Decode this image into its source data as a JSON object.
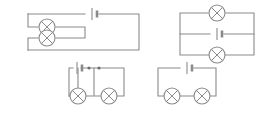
{
  "figure": {
    "background_color": "#ffffff",
    "line_color": "#8a8a8a",
    "label_color": "#5a5a5a",
    "width": 266,
    "height": 115
  },
  "circuits": [
    {
      "id": "A",
      "label": "A",
      "label_x": 12,
      "label_y": 20,
      "description": "Battery in top wire; two lamps connected in parallel with each other on the left, outer loop closing at the right",
      "lamp_count": 2,
      "battery_count": 1,
      "junction_dot_count": 0,
      "topology": "two lamps in parallel",
      "outline": "M 28 14 L 85 14 M 99 14 L 139 14 L 139 50 L 28 50",
      "battery": {
        "x": 92,
        "y": 14,
        "orientation": "horizontal"
      },
      "branch_wires": "M 28 14 L 28 27 L 38 27 M 56 27 L 85 27 L 85 38 L 56 38 M 38 38 L 28 38 L 28 50",
      "lamps": [
        {
          "cx": 47,
          "cy": 27,
          "r": 8
        },
        {
          "cx": 47,
          "cy": 38,
          "r": 8
        }
      ]
    },
    {
      "id": "B",
      "label": "B",
      "label_x": 165,
      "label_y": 20,
      "description": "Three parallel horizontal branches: lamp on top rail, battery on middle rail, lamp on bottom rail",
      "lamp_count": 2,
      "battery_count": 1,
      "junction_dot_count": 0,
      "topology": "two lamps in parallel with the battery",
      "outline": "M 180 13 L 208 13 M 226 13 L 254 13 L 254 55 L 180 55 L 180 13",
      "battery": {
        "x": 217,
        "y": 34,
        "orientation": "horizontal"
      },
      "branch_wires": "M 180 34 L 210 34 M 224 34 L 254 34",
      "lamps": [
        {
          "cx": 217,
          "cy": 13,
          "r": 8
        },
        {
          "cx": 217,
          "cy": 55,
          "r": 8
        }
      ]
    },
    {
      "id": "C",
      "label": "C",
      "label_x": 54,
      "label_y": 72,
      "description": "Battery in top rail with two junction dots; two separate loops hanging below, each containing one lamp",
      "lamp_count": 2,
      "battery_count": 1,
      "junction_dot_count": 2,
      "topology": "two lamps in parallel branches from a shared top rail",
      "outline": "M 69 68 L 73 68 M 81 68 L 124 68 L 124 96 L 109 96 M 93 96 L 78 96 L 78 68 M 69 68 L 69 96 L 70 96",
      "battery": {
        "x": 77,
        "y": 68,
        "orientation": "horizontal"
      },
      "branch_wires": "M 94 68 L 94 96 L 101 96 M 69 96 L 78 96 M 109 96 L 94 96",
      "lamps": [
        {
          "cx": 78,
          "cy": 96,
          "r": 8
        },
        {
          "cx": 109,
          "cy": 96,
          "r": 8
        }
      ],
      "nodes": [
        {
          "cx": 89,
          "cy": 68,
          "r": 1.6
        },
        {
          "cx": 99,
          "cy": 68,
          "r": 1.6
        }
      ]
    },
    {
      "id": "D",
      "label": "D",
      "label_x": 145,
      "label_y": 72,
      "description": "Single series loop: battery in top wire, two lamps side by side in the bottom wire",
      "lamp_count": 2,
      "battery_count": 1,
      "junction_dot_count": 0,
      "topology": "two lamps in series",
      "outline": "M 158 68 L 180 68 M 194 68 L 216 68 L 216 96 L 210 96 M 194 96 L 180 96 M 164 96 L 158 96 L 158 68",
      "battery": {
        "x": 187,
        "y": 68,
        "orientation": "horizontal"
      },
      "branch_wires": "",
      "lamps": [
        {
          "cx": 172,
          "cy": 96,
          "r": 8
        },
        {
          "cx": 202,
          "cy": 96,
          "r": 8
        }
      ]
    }
  ]
}
